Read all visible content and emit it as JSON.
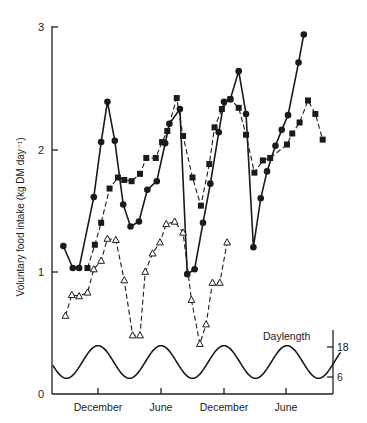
{
  "chart_data": {
    "type": "line",
    "title": "",
    "xlabel": "",
    "ylabel": "Voluntary food intake (kg DM day⁻¹)",
    "ylim": [
      0,
      3
    ],
    "yticks": [
      0,
      1,
      2,
      3
    ],
    "x_unit": "months from start (approx.)",
    "x_ticks": [
      {
        "label": "December",
        "x": 5.4
      },
      {
        "label": "June",
        "x": 11.4
      },
      {
        "label": "December",
        "x": 17.4
      },
      {
        "label": "June",
        "x": 23.4
      }
    ],
    "grid": false,
    "legend": "none",
    "series": [
      {
        "name": "Filled circles (solid line)",
        "marker": "circle-filled",
        "line": "solid",
        "points": [
          [
            2.1,
            1.21
          ],
          [
            3.0,
            1.03
          ],
          [
            3.6,
            1.03
          ],
          [
            5.0,
            1.61
          ],
          [
            5.7,
            2.06
          ],
          [
            6.3,
            2.39
          ],
          [
            7.0,
            2.07
          ],
          [
            7.8,
            1.55
          ],
          [
            8.5,
            1.37
          ],
          [
            9.3,
            1.41
          ],
          [
            10.1,
            1.67
          ],
          [
            11.0,
            1.74
          ],
          [
            11.8,
            2.05
          ],
          [
            12.2,
            2.21
          ],
          [
            13.2,
            2.33
          ],
          [
            13.9,
            0.98
          ],
          [
            14.6,
            1.02
          ],
          [
            15.4,
            1.4
          ],
          [
            16.1,
            1.72
          ],
          [
            16.9,
            2.14
          ],
          [
            17.4,
            2.39
          ],
          [
            18.0,
            2.41
          ],
          [
            18.8,
            2.64
          ],
          [
            19.5,
            2.29
          ],
          [
            20.2,
            1.2
          ],
          [
            20.9,
            1.6
          ],
          [
            21.5,
            1.82
          ],
          [
            22.3,
            2.03
          ],
          [
            22.9,
            2.16
          ],
          [
            23.5,
            2.28
          ],
          [
            24.5,
            2.71
          ],
          [
            25.0,
            2.94
          ]
        ]
      },
      {
        "name": "Filled squares (dashed line)",
        "marker": "square-filled",
        "line": "dashed",
        "points": [
          [
            4.4,
            1.03
          ],
          [
            5.1,
            1.22
          ],
          [
            5.7,
            1.4
          ],
          [
            6.5,
            1.68
          ],
          [
            7.3,
            1.77
          ],
          [
            7.9,
            1.75
          ],
          [
            8.6,
            1.74
          ],
          [
            9.4,
            1.8
          ],
          [
            10.0,
            1.93
          ],
          [
            10.9,
            1.93
          ],
          [
            11.5,
            2.06
          ],
          [
            12.0,
            2.15
          ],
          [
            12.9,
            2.42
          ],
          [
            13.5,
            2.11
          ],
          [
            14.4,
            1.77
          ],
          [
            15.2,
            1.54
          ],
          [
            16.0,
            1.88
          ],
          [
            16.5,
            2.18
          ],
          [
            17.2,
            2.33
          ],
          [
            18.0,
            2.41
          ],
          [
            18.8,
            2.34
          ],
          [
            19.5,
            2.12
          ],
          [
            20.3,
            1.81
          ],
          [
            21.1,
            1.91
          ],
          [
            21.8,
            1.93
          ],
          [
            23.4,
            2.04
          ],
          [
            23.9,
            2.13
          ],
          [
            24.6,
            2.22
          ],
          [
            25.4,
            2.4
          ],
          [
            26.1,
            2.29
          ],
          [
            26.8,
            2.08
          ]
        ]
      },
      {
        "name": "Open triangles (dashed line)",
        "marker": "triangle-open",
        "line": "dashed",
        "points": [
          [
            2.3,
            0.64
          ],
          [
            2.9,
            0.81
          ],
          [
            3.6,
            0.8
          ],
          [
            4.4,
            0.83
          ],
          [
            5.0,
            1.02
          ],
          [
            5.7,
            1.09
          ],
          [
            6.3,
            1.27
          ],
          [
            7.1,
            1.26
          ],
          [
            7.9,
            0.93
          ],
          [
            8.7,
            0.48
          ],
          [
            9.4,
            0.48
          ],
          [
            9.9,
            1.0
          ],
          [
            10.6,
            1.15
          ],
          [
            11.3,
            1.24
          ],
          [
            11.9,
            1.39
          ],
          [
            12.7,
            1.41
          ],
          [
            13.5,
            1.32
          ],
          [
            14.3,
            0.77
          ],
          [
            15.1,
            0.41
          ],
          [
            15.7,
            0.57
          ],
          [
            16.3,
            0.91
          ],
          [
            17.0,
            0.91
          ],
          [
            17.7,
            1.24
          ]
        ]
      },
      {
        "name": "Daylength",
        "axis": "right",
        "line": "solid",
        "right_ylim": [
          0,
          24
        ],
        "right_yticks": [
          6,
          18
        ],
        "description": "sinusoidal curve, peaks near December and June ticks",
        "peaks_x": [
          5.4,
          11.4,
          17.4,
          23.4
        ],
        "troughs_x": [
          8.4,
          14.4,
          20.4,
          26.4
        ],
        "peak_value": 18.5,
        "trough_value": 5.5
      }
    ],
    "annotations": [
      {
        "text": "Daylength",
        "near": "top-right of daylength curve"
      }
    ]
  },
  "labels": {
    "ylabel": "Voluntary food intake (kg DM day⁻¹)",
    "y0": "0",
    "y1": "1",
    "y2": "2",
    "y3": "3",
    "x_dec1": "December",
    "x_jun1": "June",
    "x_dec2": "December",
    "x_jun2": "June",
    "daylength": "Daylength",
    "r18": "18",
    "r6": "6"
  }
}
